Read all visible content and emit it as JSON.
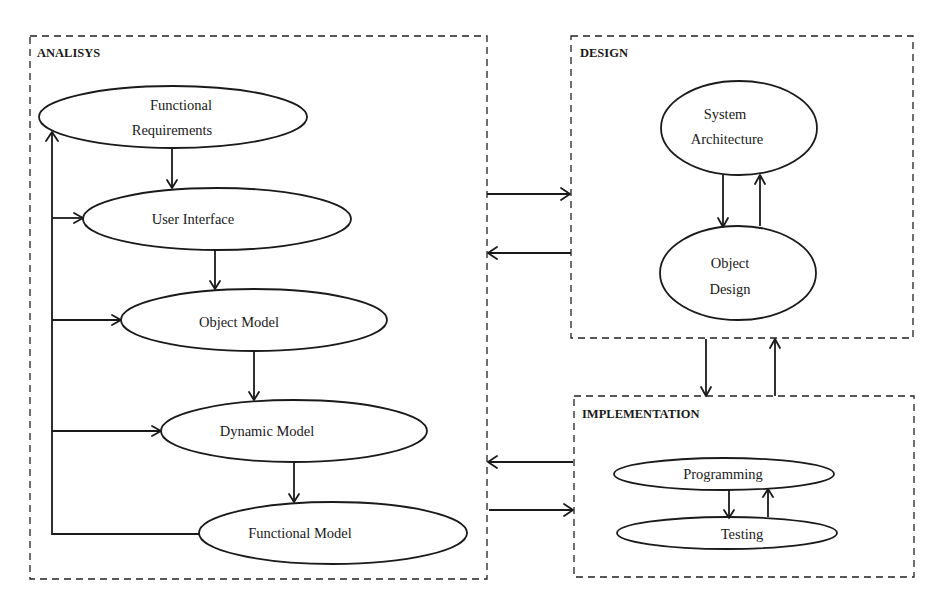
{
  "diagram": {
    "phases": {
      "analysis": {
        "label": "ANALISYS",
        "nodes": [
          {
            "id": "functional-requirements",
            "lines": [
              "Functional",
              "Requirements"
            ]
          },
          {
            "id": "user-interface",
            "lines": [
              "User Interface"
            ]
          },
          {
            "id": "object-model",
            "lines": [
              "Object Model"
            ]
          },
          {
            "id": "dynamic-model",
            "lines": [
              "Dynamic Model"
            ]
          },
          {
            "id": "functional-model",
            "lines": [
              "Functional Model"
            ]
          }
        ]
      },
      "design": {
        "label": "DESIGN",
        "nodes": [
          {
            "id": "system-architecture",
            "lines": [
              "System",
              "Architecture"
            ]
          },
          {
            "id": "object-design",
            "lines": [
              "Object",
              "Design"
            ]
          }
        ]
      },
      "implementation": {
        "label": "IMPLEMENTATION",
        "nodes": [
          {
            "id": "programming",
            "lines": [
              "Programming"
            ]
          },
          {
            "id": "testing",
            "lines": [
              "Testing"
            ]
          }
        ]
      }
    },
    "edges": [
      {
        "from": "functional-requirements",
        "to": "user-interface"
      },
      {
        "from": "user-interface",
        "to": "object-model"
      },
      {
        "from": "object-model",
        "to": "dynamic-model"
      },
      {
        "from": "dynamic-model",
        "to": "functional-model"
      },
      {
        "from": "functional-model",
        "to": "functional-requirements",
        "type": "feedback"
      },
      {
        "from": "feedback-line",
        "to": "user-interface"
      },
      {
        "from": "feedback-line",
        "to": "object-model"
      },
      {
        "from": "feedback-line",
        "to": "dynamic-model"
      },
      {
        "from": "system-architecture",
        "to": "object-design"
      },
      {
        "from": "object-design",
        "to": "system-architecture"
      },
      {
        "from": "programming",
        "to": "testing"
      },
      {
        "from": "testing",
        "to": "programming"
      },
      {
        "from": "analysis",
        "to": "design"
      },
      {
        "from": "design",
        "to": "analysis"
      },
      {
        "from": "design",
        "to": "implementation"
      },
      {
        "from": "implementation",
        "to": "design"
      },
      {
        "from": "implementation",
        "to": "analysis"
      },
      {
        "from": "analysis",
        "to": "implementation"
      }
    ]
  }
}
